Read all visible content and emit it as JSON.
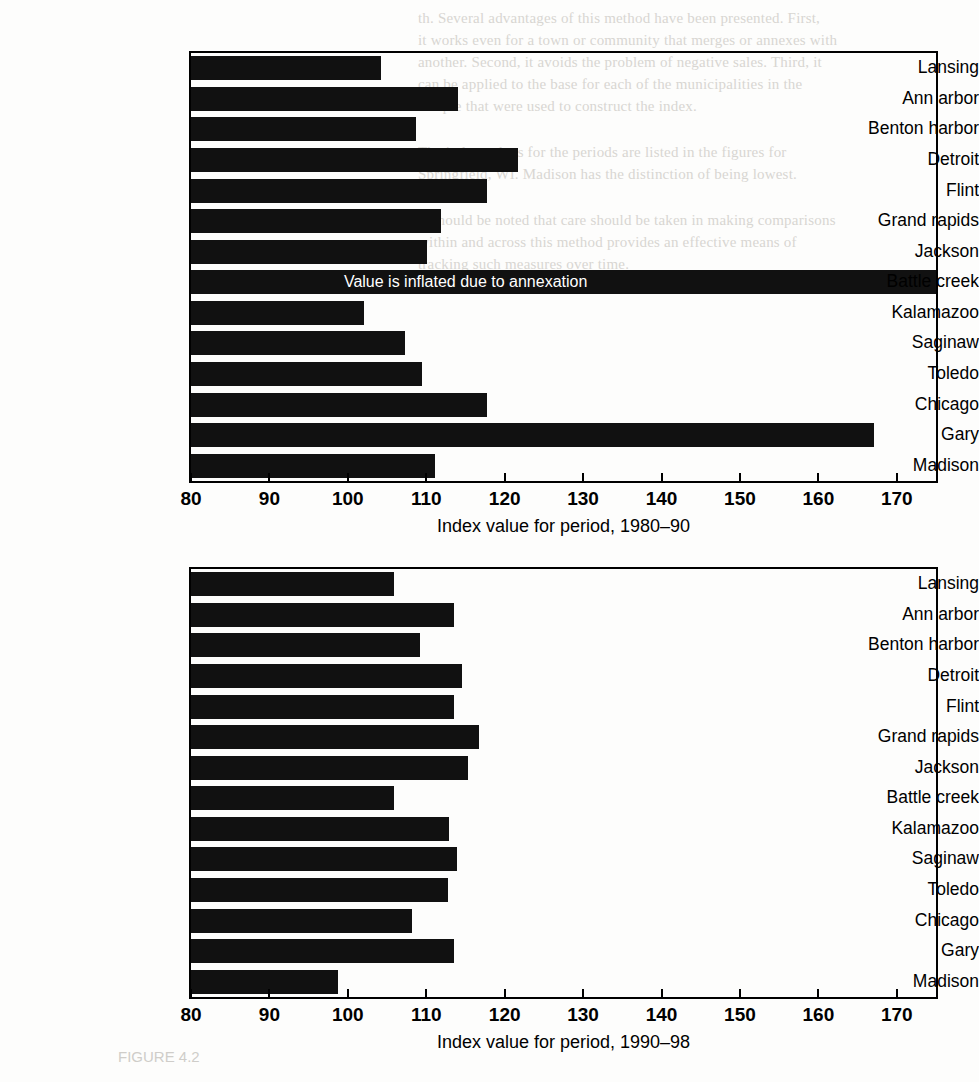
{
  "page": {
    "background_color": "#fdfdfc",
    "bar_color": "#111111",
    "annotation_text_color": "#ffffff"
  },
  "chart_data": [
    {
      "type": "bar",
      "orientation": "horizontal",
      "title": "",
      "xlabel": "Index value for period, 1980–90",
      "ylabel": "",
      "xlim": [
        80,
        175
      ],
      "xticks": [
        80,
        90,
        100,
        110,
        120,
        130,
        140,
        150,
        160,
        170
      ],
      "grid": false,
      "legend": "none",
      "categories": [
        "Lansing",
        "Ann arbor",
        "Benton harbor",
        "Detroit",
        "Flint",
        "Grand rapids",
        "Jackson",
        "Battle creek",
        "Kalamazoo",
        "Saginaw",
        "Toledo",
        "Chicago",
        "Gary",
        "Madison"
      ],
      "values": [
        104.2,
        114.0,
        108.7,
        121.7,
        117.8,
        111.9,
        110.1,
        176.0,
        102.1,
        107.3,
        109.4,
        117.7,
        167.1,
        111.1
      ],
      "annotations": [
        {
          "category": "Battle creek",
          "text": "Value is inflated due to annexation",
          "note": "bar extends past right edge of axis; value clipped"
        }
      ]
    },
    {
      "type": "bar",
      "orientation": "horizontal",
      "title": "",
      "xlabel": "Index value for period, 1990–98",
      "ylabel": "",
      "xlim": [
        80,
        175
      ],
      "xticks": [
        80,
        90,
        100,
        110,
        120,
        130,
        140,
        150,
        160,
        170
      ],
      "grid": false,
      "legend": "none",
      "categories": [
        "Lansing",
        "Ann arbor",
        "Benton harbor",
        "Detroit",
        "Flint",
        "Grand rapids",
        "Jackson",
        "Battle creek",
        "Kalamazoo",
        "Saginaw",
        "Toledo",
        "Chicago",
        "Gary",
        "Madison"
      ],
      "values": [
        105.9,
        113.6,
        109.2,
        114.5,
        113.5,
        116.7,
        115.3,
        105.9,
        112.9,
        113.9,
        112.8,
        108.2,
        113.6,
        98.8
      ],
      "annotations": []
    }
  ],
  "page_background_text": {
    "top_block": [
      "th. Several  advantages  of this  method  have  been  presented.  First,",
      "it works  even  for  a town  or  community  that  merges  or  annexes  with",
      "another.  Second,  it avoids  the  problem  of negative  sales.  Third,  it",
      "can  be  applied  to  the  base  for  each  of  the  municipalities  in  the",
      "sample  that  were  used  to  construct  the  index."
    ],
    "mid_block": [
      "The  index  values  for  the  periods  are  listed  in  the  figures  for",
      "Springfield,  WI.  Madison  has  the  distinction  of  being  lowest.",
      "",
      "It  should  be  noted  that  care  should  be  taken  in  making  comparisons",
      "within  and  across  this  method  provides  an  effective  means  of",
      "tracking  such  measures  over  time."
    ],
    "figure_caption": "FIGURE 4.2"
  }
}
